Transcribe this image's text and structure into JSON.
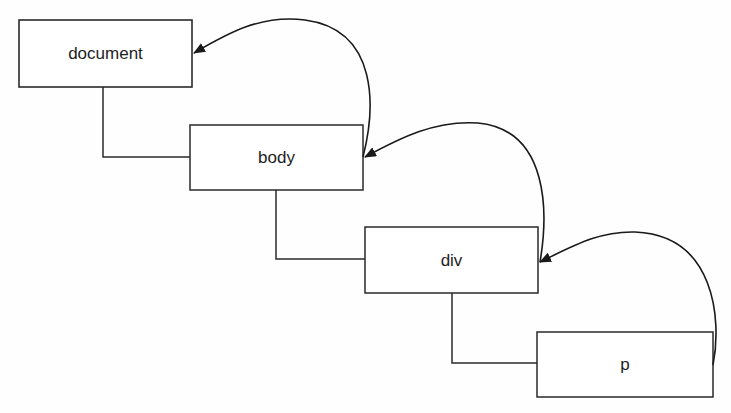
{
  "diagram": {
    "type": "dom-tree-event-bubbling",
    "nodes": [
      {
        "id": "document",
        "label": "document"
      },
      {
        "id": "body",
        "label": "body"
      },
      {
        "id": "div",
        "label": "div"
      },
      {
        "id": "p",
        "label": "p"
      }
    ],
    "tree_edges": [
      {
        "from": "document",
        "to": "body"
      },
      {
        "from": "body",
        "to": "div"
      },
      {
        "from": "div",
        "to": "p"
      }
    ],
    "arrows": [
      {
        "from": "p",
        "to": "div"
      },
      {
        "from": "div",
        "to": "body"
      },
      {
        "from": "body",
        "to": "document"
      }
    ],
    "colors": {
      "stroke": "#2a2a2a",
      "background": "#fefefe",
      "text": "#1e1e1e"
    }
  }
}
